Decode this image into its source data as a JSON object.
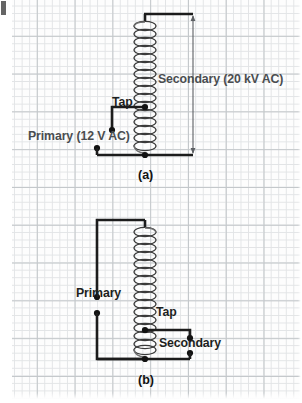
{
  "figure": {
    "colors": {
      "wire": "#1c1c1c",
      "coil": "#3a3a3a",
      "dimension": "#5d6064",
      "label_gray": "#4a4d50",
      "label_dark": "#1d1f21",
      "grid_fine": "#e2e4e6",
      "grid_coarse": "#c3c7ca",
      "paper": "#fdfdfd"
    },
    "panels": [
      {
        "id": "a",
        "caption": "(a)",
        "labels": {
          "tap": "Tap",
          "primary": "Primary (12 V AC)",
          "secondary": "Secondary (20 kV AC)"
        },
        "values": {
          "primary_voltage": "12 V AC",
          "secondary_voltage": "20 kV AC"
        }
      },
      {
        "id": "b",
        "caption": "(b)",
        "labels": {
          "primary": "Primary",
          "tap": "Tap",
          "secondary": "Secondary"
        }
      }
    ]
  }
}
